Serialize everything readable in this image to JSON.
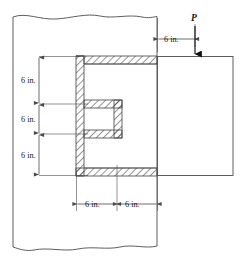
{
  "figure": {
    "type": "engineering-diagram",
    "units": "in.",
    "colors": {
      "outline": "#555555",
      "hatch": "#333333",
      "dimension": "#4a4a4a",
      "load_arrow": "#111111",
      "text": "#1a1a1a",
      "background": "#ffffff"
    }
  },
  "load": {
    "label": "P",
    "direction": "down",
    "offset_label": "6 in."
  },
  "dimensions": {
    "vertical": [
      {
        "id": "v1",
        "label": "6 in."
      },
      {
        "id": "v2",
        "label": "6 in."
      },
      {
        "id": "v3",
        "label": "6 in."
      }
    ],
    "horizontal": [
      {
        "id": "h1",
        "label": "6 in."
      },
      {
        "id": "h2",
        "label": "6 in."
      }
    ],
    "top_offset": {
      "id": "t1",
      "label": "6 in."
    }
  },
  "parts": {
    "wall_label": "wall",
    "bracket_label": "channel-section-bracket",
    "plate_label": "attached-plate"
  }
}
